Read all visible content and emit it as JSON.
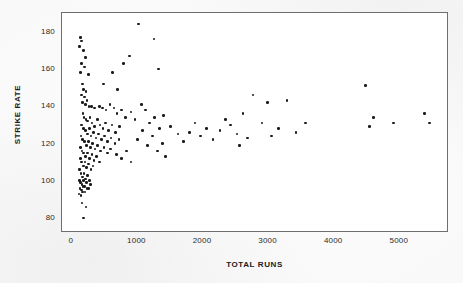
{
  "chart_data": {
    "type": "scatter",
    "title": "",
    "xlabel": "TOTAL RUNS",
    "ylabel": "STRIKE RATE",
    "xlim": [
      -150,
      5750
    ],
    "ylim": [
      72,
      190
    ],
    "xticks": [
      0,
      1000,
      2000,
      3000,
      4000,
      5000
    ],
    "xtick_labels": [
      "0",
      "1000",
      "2000",
      "3000",
      "4000",
      "5000"
    ],
    "yticks": [
      80,
      100,
      120,
      140,
      160,
      180
    ],
    "ytick_labels": [
      "80",
      "100",
      "120",
      "140",
      "160",
      "180"
    ],
    "grid": false,
    "legend": null,
    "marker": {
      "shape": "circle",
      "color": "#1b1b1b",
      "size_px": 2.6
    },
    "frame_color": "#6e6e6e",
    "background_color": "#ffffff",
    "points": [
      [
        130,
        177
      ],
      [
        150,
        175
      ],
      [
        120,
        172
      ],
      [
        175,
        170
      ],
      [
        210,
        166
      ],
      [
        150,
        163
      ],
      [
        190,
        161
      ],
      [
        135,
        158
      ],
      [
        250,
        157
      ],
      [
        160,
        152
      ],
      [
        175,
        149
      ],
      [
        215,
        148
      ],
      [
        480,
        152
      ],
      [
        700,
        149
      ],
      [
        1020,
        184
      ],
      [
        1250,
        176
      ],
      [
        1320,
        160
      ],
      [
        880,
        167
      ],
      [
        790,
        163
      ],
      [
        620,
        158
      ],
      [
        150,
        146
      ],
      [
        195,
        145
      ],
      [
        230,
        143
      ],
      [
        165,
        142
      ],
      [
        205,
        141
      ],
      [
        260,
        140
      ],
      [
        300,
        140
      ],
      [
        350,
        139
      ],
      [
        420,
        140
      ],
      [
        470,
        139
      ],
      [
        520,
        138
      ],
      [
        580,
        141
      ],
      [
        640,
        139
      ],
      [
        690,
        136
      ],
      [
        760,
        138
      ],
      [
        820,
        134
      ],
      [
        900,
        137
      ],
      [
        960,
        133
      ],
      [
        1060,
        141
      ],
      [
        1120,
        138
      ],
      [
        1180,
        131
      ],
      [
        1260,
        134
      ],
      [
        1340,
        128
      ],
      [
        1400,
        135
      ],
      [
        170,
        136
      ],
      [
        185,
        134
      ],
      [
        215,
        133
      ],
      [
        240,
        132
      ],
      [
        275,
        134
      ],
      [
        310,
        131
      ],
      [
        345,
        129
      ],
      [
        390,
        133
      ],
      [
        430,
        130
      ],
      [
        475,
        128
      ],
      [
        510,
        131
      ],
      [
        560,
        127
      ],
      [
        610,
        130
      ],
      [
        670,
        126
      ],
      [
        730,
        129
      ],
      [
        150,
        130
      ],
      [
        180,
        128
      ],
      [
        205,
        127
      ],
      [
        235,
        125
      ],
      [
        265,
        128
      ],
      [
        295,
        124
      ],
      [
        330,
        126
      ],
      [
        370,
        123
      ],
      [
        410,
        125
      ],
      [
        450,
        122
      ],
      [
        500,
        124
      ],
      [
        545,
        121
      ],
      [
        600,
        123
      ],
      [
        660,
        120
      ],
      [
        720,
        122
      ],
      [
        140,
        124
      ],
      [
        165,
        122
      ],
      [
        190,
        121
      ],
      [
        220,
        119
      ],
      [
        250,
        121
      ],
      [
        280,
        118
      ],
      [
        315,
        120
      ],
      [
        355,
        117
      ],
      [
        395,
        119
      ],
      [
        440,
        116
      ],
      [
        490,
        118
      ],
      [
        540,
        115
      ],
      [
        590,
        117
      ],
      [
        130,
        118
      ],
      [
        155,
        116
      ],
      [
        180,
        115
      ],
      [
        205,
        113
      ],
      [
        235,
        115
      ],
      [
        270,
        112
      ],
      [
        305,
        114
      ],
      [
        340,
        111
      ],
      [
        380,
        113
      ],
      [
        425,
        110
      ],
      [
        130,
        112
      ],
      [
        150,
        110
      ],
      [
        175,
        108
      ],
      [
        200,
        110
      ],
      [
        225,
        107
      ],
      [
        255,
        109
      ],
      [
        290,
        106
      ],
      [
        325,
        108
      ],
      [
        120,
        106
      ],
      [
        140,
        104
      ],
      [
        160,
        102
      ],
      [
        185,
        104
      ],
      [
        210,
        101
      ],
      [
        240,
        103
      ],
      [
        270,
        100
      ],
      [
        115,
        100
      ],
      [
        135,
        99
      ],
      [
        155,
        98
      ],
      [
        175,
        100
      ],
      [
        195,
        97
      ],
      [
        220,
        99
      ],
      [
        250,
        96
      ],
      [
        285,
        98
      ],
      [
        125,
        96
      ],
      [
        145,
        95
      ],
      [
        170,
        97
      ],
      [
        200,
        94
      ],
      [
        230,
        96
      ],
      [
        110,
        93
      ],
      [
        140,
        92
      ],
      [
        165,
        94
      ],
      [
        155,
        88
      ],
      [
        215,
        86
      ],
      [
        175,
        80
      ],
      [
        680,
        114
      ],
      [
        760,
        112
      ],
      [
        830,
        116
      ],
      [
        900,
        110
      ],
      [
        1000,
        122
      ],
      [
        1080,
        127
      ],
      [
        1150,
        119
      ],
      [
        1230,
        124
      ],
      [
        1310,
        116
      ],
      [
        1380,
        120
      ],
      [
        1430,
        113
      ],
      [
        1500,
        129
      ],
      [
        1620,
        125
      ],
      [
        1700,
        121
      ],
      [
        1790,
        126
      ],
      [
        1880,
        131
      ],
      [
        1960,
        124
      ],
      [
        2050,
        128
      ],
      [
        2150,
        122
      ],
      [
        2260,
        127
      ],
      [
        2340,
        133
      ],
      [
        2420,
        130
      ],
      [
        2520,
        125
      ],
      [
        2610,
        136
      ],
      [
        2680,
        123
      ],
      [
        2760,
        146
      ],
      [
        2980,
        142
      ],
      [
        3150,
        128
      ],
      [
        3280,
        143
      ],
      [
        3420,
        126
      ],
      [
        3560,
        131
      ],
      [
        4480,
        151
      ],
      [
        4540,
        129
      ],
      [
        4600,
        134
      ],
      [
        4900,
        131
      ],
      [
        5380,
        136
      ],
      [
        5450,
        131
      ],
      [
        2560,
        119
      ],
      [
        2900,
        131
      ],
      [
        3040,
        124
      ]
    ]
  }
}
